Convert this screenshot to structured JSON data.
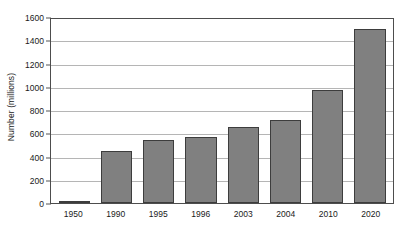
{
  "chart_data": {
    "type": "bar",
    "title": "",
    "subtitle": "",
    "xlabel": "",
    "ylabel": "Number (millions)",
    "categories": [
      "1950",
      "1990",
      "1995",
      "1996",
      "2003",
      "2004",
      "2010",
      "2020"
    ],
    "values": [
      20,
      450,
      550,
      570,
      665,
      720,
      985,
      1510
    ],
    "series": [
      {
        "name": "Number (millions)",
        "values": [
          20,
          450,
          550,
          570,
          665,
          720,
          985,
          1510
        ]
      }
    ],
    "ylim": [
      0,
      1600
    ],
    "y_ticks": [
      0,
      200,
      400,
      600,
      800,
      1000,
      1200,
      1400,
      1600
    ],
    "y_tick_labels": [
      "0",
      "200",
      "400",
      "600",
      "800",
      "1000",
      "1200",
      "1400",
      "1600"
    ],
    "grid": true,
    "grid_axis": "y",
    "legend": false,
    "legend_position": "none",
    "bar_color": "#808080",
    "bar_edge_color": "#3d3d3d",
    "grid_color": "#b5b5b5",
    "axis_color": "#4d4d4d",
    "plot_background": "#ffffff",
    "annotations": []
  }
}
